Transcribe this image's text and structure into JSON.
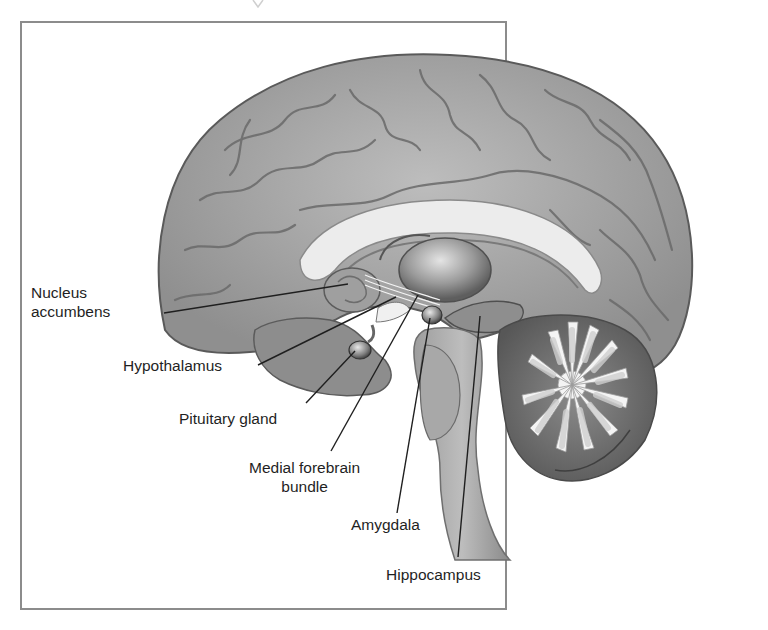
{
  "figure": {
    "frame_color": "#8c8c8c",
    "colors": {
      "cortex": "#a9a9a9",
      "cortex_dark": "#6e6e6e",
      "white_matter": "#e6e6e6",
      "label_text": "#1f1f1f",
      "leader_line": "#1f1f1f"
    }
  },
  "labels": [
    {
      "id": "nucleus-accumbens",
      "line1": "Nucleus",
      "line2": "accumbens"
    },
    {
      "id": "hypothalamus",
      "line1": "Hypothalamus"
    },
    {
      "id": "pituitary-gland",
      "line1": "Pituitary gland"
    },
    {
      "id": "medial-forebrain-bundle",
      "line1": "Medial forebrain",
      "line2": "bundle"
    },
    {
      "id": "amygdala",
      "line1": "Amygdala"
    },
    {
      "id": "hippocampus",
      "line1": "Hippocampus"
    }
  ]
}
